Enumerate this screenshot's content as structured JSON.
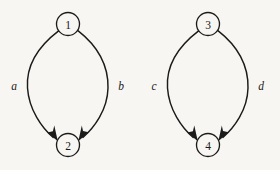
{
  "figure": {
    "background_color": "#f7f6f2",
    "ink_color": "#1b1b1b",
    "width": 280,
    "height": 170,
    "caption": ""
  },
  "diagram": {
    "type": "directed-multigraph",
    "graphs": [
      {
        "id": "graph-left",
        "nodes": [
          {
            "id": "n1",
            "label": "1",
            "cx": 68,
            "cy": 24,
            "r": 11.5
          },
          {
            "id": "n2",
            "label": "2",
            "cx": 68,
            "cy": 145,
            "r": 11.5
          }
        ],
        "edges": [
          {
            "id": "edge-a",
            "label": "a",
            "from": "n1",
            "to": "n2",
            "side": "left",
            "label_x": 14,
            "label_y": 86,
            "directed": true
          },
          {
            "id": "edge-b",
            "label": "b",
            "from": "n1",
            "to": "n2",
            "side": "right",
            "label_x": 121,
            "label_y": 86,
            "directed": true
          }
        ]
      },
      {
        "id": "graph-right",
        "nodes": [
          {
            "id": "n3",
            "label": "3",
            "cx": 208,
            "cy": 24,
            "r": 11.5
          },
          {
            "id": "n4",
            "label": "4",
            "cx": 208,
            "cy": 145,
            "r": 11.5
          }
        ],
        "edges": [
          {
            "id": "edge-c",
            "label": "c",
            "from": "n3",
            "to": "n4",
            "side": "left",
            "label_x": 154,
            "label_y": 86,
            "directed": true
          },
          {
            "id": "edge-d",
            "label": "d",
            "from": "n3",
            "to": "n4",
            "side": "right",
            "label_x": 261,
            "label_y": 86,
            "directed": true
          }
        ]
      }
    ]
  }
}
